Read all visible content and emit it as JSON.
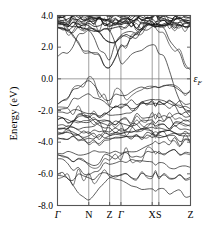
{
  "figure": {
    "kind": "band-structure-plot",
    "background": "#ffffff",
    "line_color": "#1a1a1a",
    "frame_color": "#555555",
    "grid_color": "#777777"
  },
  "axes": {
    "ylabel": "Energy (eV)",
    "yticks": [
      "4.0",
      "2.0",
      "0.0",
      "-2.0",
      "-4.0",
      "-6.0",
      "-8.0"
    ],
    "ytick_values": [
      4.0,
      2.0,
      0.0,
      -2.0,
      -4.0,
      -6.0,
      -8.0
    ],
    "ylim": [
      -8.0,
      4.0
    ],
    "xticks": [
      "Γ",
      "N",
      "Z",
      "Γ",
      "X",
      "S",
      "Z"
    ],
    "xtick_positions": [
      0.0,
      0.235,
      0.392,
      0.477,
      0.712,
      0.762,
      1.0
    ],
    "xlim": [
      0.0,
      1.0
    ],
    "grid": "vertical-at-high-symmetry-points"
  },
  "annotations": {
    "fermi_label": "ε",
    "fermi_sub": "F",
    "fermi_level": 0.0
  },
  "chart_data": {
    "type": "line",
    "title": "",
    "xlabel": "",
    "ylabel": "Energy (eV)",
    "ylim": [
      -8.0,
      4.0
    ],
    "xlim": [
      0.0,
      1.0
    ],
    "grid": true,
    "legend": "none",
    "x": [
      0.0,
      0.235,
      0.392,
      0.477,
      0.712,
      0.762,
      1.0
    ],
    "tick_labels": [
      "Γ",
      "N",
      "Z",
      "Γ",
      "X",
      "S",
      "Z"
    ],
    "series": [
      {
        "name": "c1",
        "values": [
          3.95,
          4.0,
          3.92,
          3.95,
          4.0,
          3.98,
          3.95
        ]
      },
      {
        "name": "c2",
        "values": [
          3.88,
          3.95,
          3.8,
          3.86,
          3.95,
          3.9,
          3.88
        ]
      },
      {
        "name": "c3",
        "values": [
          3.8,
          3.88,
          3.7,
          3.78,
          3.88,
          3.82,
          3.8
        ]
      },
      {
        "name": "c4",
        "values": [
          3.72,
          3.8,
          3.62,
          3.7,
          3.82,
          3.74,
          3.72
        ]
      },
      {
        "name": "c5",
        "values": [
          3.62,
          3.72,
          3.5,
          3.6,
          3.75,
          3.66,
          3.62
        ]
      },
      {
        "name": "c6",
        "values": [
          3.55,
          3.62,
          3.4,
          3.52,
          3.62,
          3.56,
          3.55
        ]
      },
      {
        "name": "c7",
        "values": [
          3.45,
          3.5,
          3.3,
          3.42,
          3.45,
          3.44,
          3.45
        ]
      },
      {
        "name": "c8",
        "values": [
          3.4,
          3.35,
          3.15,
          3.3,
          3.4,
          3.38,
          3.4
        ]
      },
      {
        "name": "c9",
        "values": [
          3.2,
          3.1,
          2.3,
          2.6,
          3.4,
          3.35,
          3.35
        ]
      },
      {
        "name": "c10",
        "values": [
          1.4,
          3.05,
          1.2,
          2.75,
          3.35,
          3.3,
          3.3
        ]
      },
      {
        "name": "c11",
        "values": [
          3.3,
          1.75,
          0.72,
          2.05,
          3.3,
          3.28,
          0.7
        ]
      },
      {
        "name": "c12",
        "values": [
          3.25,
          3.15,
          3.05,
          1.0,
          2.15,
          1.6,
          -2.4
        ]
      },
      {
        "name": "v1",
        "values": [
          -1.6,
          -0.12,
          -1.35,
          -1.05,
          -0.55,
          -0.55,
          -0.8
        ]
      },
      {
        "name": "v2",
        "values": [
          -1.95,
          -0.95,
          -1.75,
          -1.6,
          -1.3,
          -1.32,
          -1.55
        ]
      },
      {
        "name": "v3",
        "values": [
          -2.1,
          -2.2,
          -2.05,
          -1.85,
          -1.45,
          -1.45,
          -1.9
        ]
      },
      {
        "name": "v4",
        "values": [
          -2.35,
          -2.45,
          -2.3,
          -2.25,
          -1.6,
          -1.62,
          -2.1
        ]
      },
      {
        "name": "v5",
        "values": [
          -2.6,
          -2.75,
          -2.7,
          -2.6,
          -2.4,
          -2.45,
          -2.35
        ]
      },
      {
        "name": "v6",
        "values": [
          -2.95,
          -3.05,
          -2.95,
          -2.8,
          -2.6,
          -2.62,
          -2.75
        ]
      },
      {
        "name": "v7",
        "values": [
          -3.2,
          -2.35,
          -3.1,
          -3.15,
          -2.85,
          -2.88,
          -3.0
        ]
      },
      {
        "name": "v8",
        "values": [
          -3.35,
          -3.45,
          -3.35,
          -3.3,
          -3.05,
          -3.1,
          -3.25
        ]
      },
      {
        "name": "v9",
        "values": [
          -3.45,
          -3.6,
          -3.5,
          -3.45,
          -3.3,
          -3.35,
          -3.45
        ]
      },
      {
        "name": "v10",
        "values": [
          -3.55,
          -3.75,
          -3.6,
          -3.55,
          -3.5,
          -3.55,
          -3.6
        ]
      },
      {
        "name": "v11",
        "values": [
          -3.8,
          -4.05,
          -3.85,
          -3.7,
          -3.7,
          -3.72,
          -3.85
        ]
      },
      {
        "name": "v12",
        "values": [
          -4.7,
          -4.7,
          -4.7,
          -4.7,
          -4.1,
          -4.1,
          -3.95
        ]
      },
      {
        "name": "v13",
        "values": [
          -4.75,
          -5.35,
          -4.85,
          -4.8,
          -4.65,
          -4.7,
          -4.7
        ]
      },
      {
        "name": "v14",
        "values": [
          -5.05,
          -6.05,
          -5.4,
          -5.2,
          -5.25,
          -5.3,
          -5.6
        ]
      },
      {
        "name": "v15",
        "values": [
          -6.05,
          -6.25,
          -6.05,
          -6.05,
          -6.15,
          -6.2,
          -6.2
        ]
      },
      {
        "name": "v16",
        "values": [
          -6.1,
          -7.65,
          -6.25,
          -6.4,
          -6.95,
          -6.95,
          -7.4
        ]
      }
    ]
  }
}
